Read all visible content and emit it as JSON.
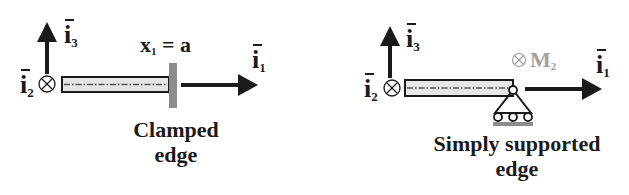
{
  "panels": [
    {
      "id": "clamped",
      "axes": {
        "i1": {
          "base": "i",
          "sub": "1"
        },
        "i2": {
          "base": "i",
          "sub": "2"
        },
        "i3": {
          "base": "i",
          "sub": "3"
        }
      },
      "position_label": "x₁ = a",
      "position_label_parts": {
        "var": "x",
        "sub": "1",
        "rest": " = a"
      },
      "caption_line1": "Clamped",
      "caption_line2": "edge",
      "support_type": "clamped"
    },
    {
      "id": "simply-supported",
      "axes": {
        "i1": {
          "base": "i",
          "sub": "1"
        },
        "i2": {
          "base": "i",
          "sub": "2"
        },
        "i3": {
          "base": "i",
          "sub": "3"
        }
      },
      "moment_label": {
        "base": "M",
        "sub": "2"
      },
      "caption_line1": "Simply supported",
      "caption_line2": "edge",
      "support_type": "pinned-roller"
    }
  ],
  "colors": {
    "ink": "#1a1a1a",
    "beam_fill": "#e6e6e6",
    "support_gray": "#8c8c8c",
    "moment_gray": "#a0a0a0"
  }
}
